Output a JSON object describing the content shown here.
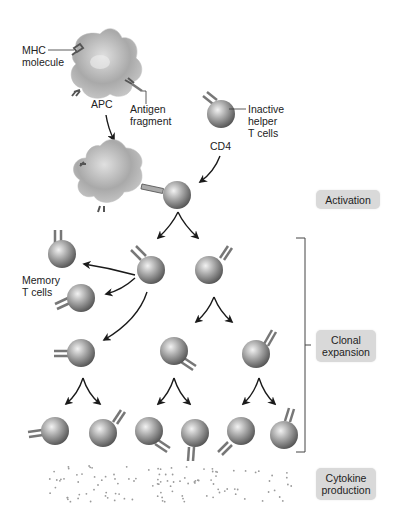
{
  "labels": {
    "mhc_line1": "MHC",
    "mhc_line2": "molecule",
    "apc": "APC",
    "antigen_line1": "Antigen",
    "antigen_line2": "fragment",
    "inactive_line1": "Inactive",
    "inactive_line2": "helper",
    "inactive_line3": "T cells",
    "cd4": "CD4",
    "memory_line1": "Memory",
    "memory_line2": "T cells"
  },
  "stages": [
    {
      "id": "activation",
      "label": "Activation"
    },
    {
      "id": "clonal",
      "line1": "Clonal",
      "line2": "expansion"
    },
    {
      "id": "cytokine",
      "line1": "Cytokine",
      "line2": "production"
    }
  ],
  "colors": {
    "cell_light": "#e8e8e8",
    "cell_dark": "#5a5a5a",
    "stage_bg": "#d9d9d9",
    "arrow": "#1a1a1a",
    "dots": "#9a9a9a"
  }
}
